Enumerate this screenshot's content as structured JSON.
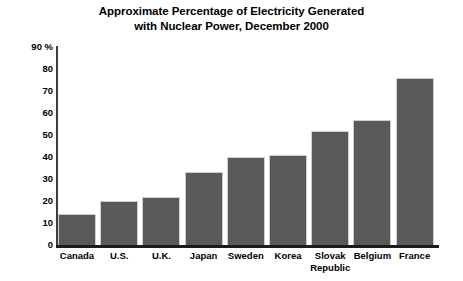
{
  "chart_data": {
    "type": "bar",
    "title": "Approximate Percentage of Electricity Generated with Nuclear Power, December 2000",
    "title_lines": [
      "Approximate Percentage of Electricity Generated",
      "with Nuclear Power, December 2000"
    ],
    "xlabel": "",
    "ylabel": "",
    "ylim": [
      0,
      90
    ],
    "ytick_step": 10,
    "ytick_labels": [
      "90 %",
      "80",
      "70",
      "60",
      "50",
      "40",
      "30",
      "20",
      "10",
      "0"
    ],
    "ytick_values": [
      90,
      80,
      70,
      60,
      50,
      40,
      30,
      20,
      10,
      0
    ],
    "grid": false,
    "legend": false,
    "bar_color": "#595959",
    "categories": [
      "Canada",
      "U.S.",
      "U.K.",
      "Japan",
      "Sweden",
      "Korea",
      "Slovak\nRepublic",
      "Belgium",
      "France"
    ],
    "values": [
      14,
      20,
      22,
      33,
      40,
      41,
      52,
      57,
      76
    ],
    "bars": [
      {
        "label": "Canada",
        "value": 14
      },
      {
        "label": "U.S.",
        "value": 20
      },
      {
        "label": "U.K.",
        "value": 22
      },
      {
        "label": "Japan",
        "value": 33
      },
      {
        "label": "Sweden",
        "value": 40
      },
      {
        "label": "Korea",
        "value": 41
      },
      {
        "label": "Slovak\nRepublic",
        "value": 52
      },
      {
        "label": "Belgium",
        "value": 57
      },
      {
        "label": "France",
        "value": 76
      }
    ]
  }
}
